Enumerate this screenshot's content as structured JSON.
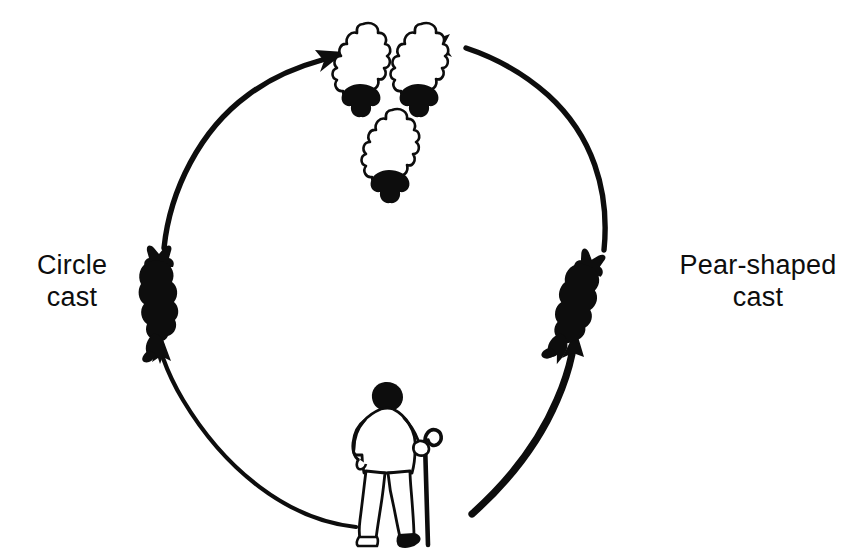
{
  "diagram": {
    "kind": "cycle-diagram",
    "background_color": "#ffffff",
    "ink_color": "#0d0d0d",
    "labels": {
      "circle_cast": "Circle\ncast",
      "circle_cast_line1": "Circle",
      "circle_cast_line2": "cast",
      "pear_shaped_cast": "Pear-shaped\ncast",
      "pear_shaped_cast_line1": "Pear-shaped",
      "pear_shaped_cast_line2": "cast"
    },
    "figures": [
      {
        "name": "sheep-group",
        "icon": "sheep-flock-icon",
        "count": 3,
        "description": "Three sheep seen from above, white fleece bodies with black heads",
        "position": "top-center"
      },
      {
        "name": "dog-circle-cast",
        "icon": "dog-silhouette-icon",
        "description": "Black sheepdog silhouette, upright, left side of cycle",
        "position": "mid-left"
      },
      {
        "name": "dog-pear-shaped-cast",
        "icon": "dog-silhouette-icon",
        "description": "Black sheepdog silhouette, angled, right side of cycle",
        "position": "mid-right"
      },
      {
        "name": "shepherd",
        "icon": "shepherd-with-crook-icon",
        "description": "Shepherd seen from behind holding a crook in the right hand",
        "position": "bottom-center"
      }
    ],
    "arrows": [
      {
        "name": "arrow-shepherd-to-circle-cast",
        "from": "shepherd",
        "to": "dog-circle-cast",
        "direction": "counter-clockwise",
        "weight": "thin"
      },
      {
        "name": "arrow-circle-cast-to-sheep",
        "from": "dog-circle-cast",
        "to": "sheep-group",
        "direction": "clockwise-up-right",
        "weight": "medium"
      },
      {
        "name": "arrow-shepherd-to-pear-cast",
        "from": "shepherd",
        "to": "dog-pear-shaped-cast",
        "direction": "clockwise",
        "weight": "thick"
      },
      {
        "name": "arrow-pear-cast-to-sheep",
        "from": "dog-pear-shaped-cast",
        "to": "sheep-group",
        "direction": "counter-clockwise-up-left",
        "weight": "medium"
      }
    ]
  }
}
